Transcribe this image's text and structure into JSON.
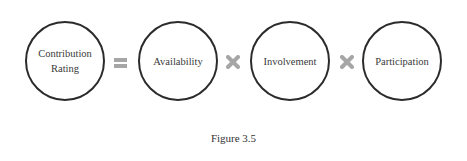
{
  "diagram": {
    "terms": [
      {
        "label_line1": "Contribution",
        "label_line2": "Rating"
      },
      {
        "label": "Availability"
      },
      {
        "label": "Involvement"
      },
      {
        "label": "Participation"
      }
    ],
    "operators": [
      "equals",
      "multiply",
      "multiply"
    ],
    "operator_color": "#a6a6a6",
    "circle_border_color": "#2b2b2b"
  },
  "caption": "Figure 3.5"
}
